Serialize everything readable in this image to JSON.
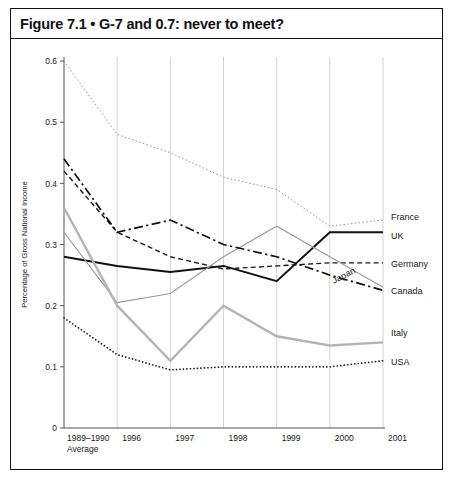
{
  "figure": {
    "title": "Figure 7.1 • G-7 and 0.7: never to meet?"
  },
  "chart_data": {
    "type": "line",
    "title": "Figure 7.1 • G-7 and 0.7: never to meet?",
    "xlabel": "",
    "ylabel": "Percentage of Gross National Income",
    "categories": [
      "1989–1990 Average",
      "1996",
      "1997",
      "1998",
      "1999",
      "2000",
      "2001"
    ],
    "tick_labels_x": [
      "1989–1990",
      "1996",
      "1997",
      "1998",
      "1999",
      "2000",
      "2001"
    ],
    "x_tick_sublabel": "Average",
    "ylim": [
      0,
      0.6
    ],
    "y_ticks": [
      0,
      0.1,
      0.2,
      0.3,
      0.4,
      0.5,
      0.6
    ],
    "y_tick_labels": [
      "0",
      "0.1",
      "0.2",
      "0.3",
      "0.4",
      "0.5",
      "0.6"
    ],
    "grid": "vertical",
    "legend_position": "right-inline",
    "series": [
      {
        "name": "France",
        "values": [
          0.6,
          0.48,
          0.45,
          0.41,
          0.39,
          0.33,
          0.34
        ],
        "color": "#9a9a9a",
        "style": "dotted-fine",
        "width": 1.0,
        "label_y": 0.345
      },
      {
        "name": "UK",
        "values": [
          0.28,
          0.265,
          0.255,
          0.265,
          0.24,
          0.32,
          0.32
        ],
        "color": "#111111",
        "style": "solid",
        "width": 2.0,
        "label_y": 0.315
      },
      {
        "name": "Germany",
        "values": [
          0.42,
          0.32,
          0.28,
          0.26,
          0.265,
          0.27,
          0.27
        ],
        "color": "#1a1a1a",
        "style": "dashed-short",
        "width": 1.4,
        "label_y": 0.268
      },
      {
        "name": "Japan",
        "values": [
          0.32,
          0.205,
          0.22,
          0.28,
          0.33,
          0.28,
          0.23
        ],
        "color": "#9a9a9a",
        "style": "solid",
        "width": 1.1,
        "label_y": 0.245,
        "inline_label": true,
        "inline_label_rotation": -27
      },
      {
        "name": "Canada",
        "values": [
          0.44,
          0.32,
          0.34,
          0.3,
          0.28,
          0.25,
          0.225
        ],
        "color": "#111111",
        "style": "dash-dot",
        "width": 1.7,
        "label_y": 0.225
      },
      {
        "name": "Italy",
        "values": [
          0.36,
          0.2,
          0.11,
          0.2,
          0.15,
          0.135,
          0.14
        ],
        "color": "#b4b4b4",
        "style": "solid",
        "width": 2.4,
        "label_y": 0.155
      },
      {
        "name": "USA",
        "values": [
          0.18,
          0.12,
          0.095,
          0.1,
          0.1,
          0.1,
          0.11
        ],
        "color": "#1a1a1a",
        "style": "dotted-round",
        "width": 1.7,
        "label_y": 0.108
      }
    ]
  }
}
